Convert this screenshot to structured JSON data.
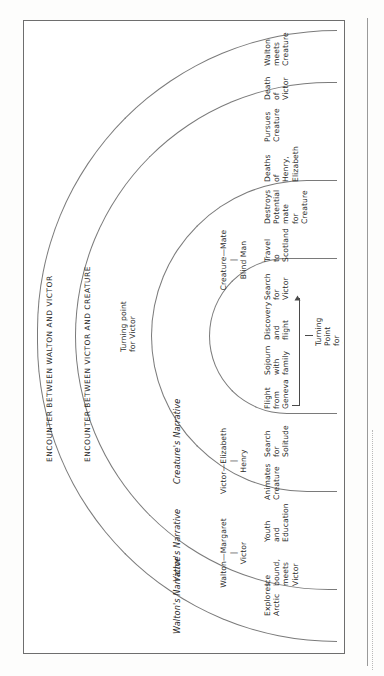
{
  "figure": {
    "type": "nested-arc narrative structure diagram",
    "orientation": "rotated 90 degrees counter-clockwise on the page"
  },
  "rings": [
    {
      "id": "walton",
      "label": "Walton's Narrative"
    },
    {
      "id": "victor",
      "label": "Victor's Narrative"
    },
    {
      "id": "creature",
      "label": "Creature's Narrative"
    }
  ],
  "relationships": [
    {
      "id": "walton-margaret",
      "top": "Walton—Margaret",
      "connector": "|",
      "bottom": "Victor"
    },
    {
      "id": "victor-elizabeth",
      "top": "Victor—Elizabeth",
      "connector": "|",
      "bottom": "Henry"
    },
    {
      "id": "creature-mate",
      "top": "Creature—Mate",
      "connector": "|",
      "bottom": "Blind Man"
    }
  ],
  "events": {
    "walton": [
      {
        "id": "explores-arctic",
        "text": "Explores\nArctic"
      },
      {
        "id": "ice-bound",
        "text": "Ice\nbound,\nmeets\nVictor"
      }
    ],
    "victor": [
      {
        "id": "youth-education",
        "text": "Youth\nand\nEducation"
      },
      {
        "id": "animates-creature",
        "text": "Animates\nCreature"
      },
      {
        "id": "search-solitude",
        "text": "Search\nfor\nSolitude"
      }
    ],
    "creature": [
      {
        "id": "flight-geneva",
        "text": "Flight\nfrom\nGeneva"
      },
      {
        "id": "sojourn-family",
        "text": "Sojourn\nwith\nfamily"
      },
      {
        "id": "discovery-flight",
        "text": "Discovery\nand\nflight"
      },
      {
        "id": "search-victor",
        "text": "Search\nfor\nVictor"
      }
    ],
    "victor_late": [
      {
        "id": "travel-scotland",
        "text": "Travel\nto\nScotland"
      },
      {
        "id": "destroys-mate",
        "text": "Destroys\nPotential\nmate\nfor\nCreature"
      },
      {
        "id": "deaths-henry-elizabeth",
        "text": "Deaths\nof\nHenry,\nElizabeth"
      },
      {
        "id": "pursues-creature",
        "text": "Pursues\nCreature"
      }
    ],
    "walton_late": [
      {
        "id": "death-of-victor",
        "text": "Death\nof\nVictor"
      },
      {
        "id": "walton-meets-creature",
        "text": "Walton\nmeets\nCreature"
      }
    ]
  },
  "turning_points": [
    {
      "id": "turning-point-creature",
      "text": "Turning\nPoint\nfor\nCreature"
    },
    {
      "id": "turning-point-victor",
      "text": "Turning point\nfor Victor"
    }
  ],
  "encounters": [
    {
      "id": "encounter-victor-creature",
      "text": "ENCOUNTER BETWEEN VICTOR AND CREATURE"
    },
    {
      "id": "encounter-walton-victor",
      "text": "ENCOUNTER BETWEEN WALTON AND VICTOR"
    }
  ],
  "colors": {
    "ink": "#2b2b2b",
    "rule": "#7a7a7a",
    "page": "#ffffff",
    "background": "#fdfdfc"
  }
}
